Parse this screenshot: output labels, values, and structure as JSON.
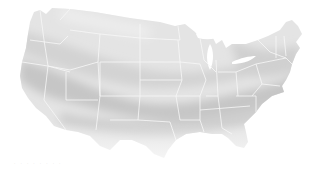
{
  "map": {
    "subject": "Contiguous United States",
    "style": "grayscale shaded zones with white state borders",
    "colors": {
      "background": "#ffffff",
      "land_light": "#e6e6e6",
      "land_mid": "#d6d6d6",
      "land_dark": "#c4c4c4",
      "border": "#f7f7f7"
    }
  },
  "caption": {
    "text": "· ·  · ·  ·      ·   · ·"
  }
}
